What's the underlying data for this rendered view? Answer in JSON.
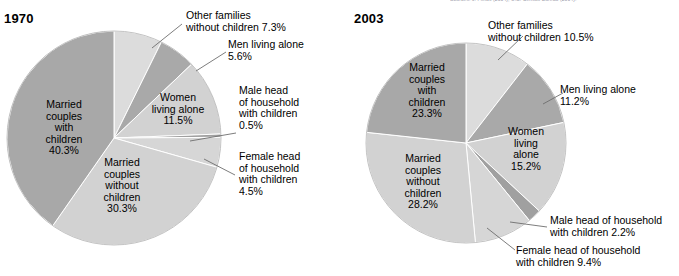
{
  "figure": {
    "clipped_source_line": "Sources: J. Fields (2004), U.S. Census Bureau (2004)."
  },
  "panels": [
    {
      "title": "1970",
      "center": [
        114,
        138
      ],
      "radius": 107,
      "slices": [
        {
          "name": "other-families-without-children",
          "label": "Other families\nwithout children 7.3%",
          "value": 7.3,
          "color": "#dcdcdc"
        },
        {
          "name": "men-living-alone",
          "label": "Men living alone\n5.6%",
          "value": 5.6,
          "color": "#a9a9a9"
        },
        {
          "name": "women-living-alone",
          "label": "Women\nliving alone\n11.5%",
          "value": 11.5,
          "color": "#d2d2d2"
        },
        {
          "name": "male-head-of-household-with-children",
          "label": "Male head\nof household\nwith children\n0.5%",
          "value": 0.5,
          "color": "#a0a0a0"
        },
        {
          "name": "female-head-of-household-with-children",
          "label": "Female head\nof household\nwith children\n4.5%",
          "value": 4.5,
          "color": "#d6d6d6"
        },
        {
          "name": "married-couples-without-children",
          "label": "Married\ncouples\nwithout\nchildren\n30.3%",
          "value": 30.3,
          "color": "#d2d2d2"
        },
        {
          "name": "married-couples-with-children",
          "label": "Married\ncouples\nwith\nchildren\n40.3%",
          "value": 40.3,
          "color": "#a8a8a8"
        }
      ]
    },
    {
      "title": "2003",
      "center": [
        466,
        143
      ],
      "radius": 100,
      "slices": [
        {
          "name": "other-families-without-children",
          "label": "Other families\nwithout children 10.5%",
          "value": 10.5,
          "color": "#dcdcdc"
        },
        {
          "name": "men-living-alone",
          "label": "Men living alone\n11.2%",
          "value": 11.2,
          "color": "#a9a9a9"
        },
        {
          "name": "women-living-alone",
          "label": "Women\nliving\nalone\n15.2%",
          "value": 15.2,
          "color": "#d2d2d2"
        },
        {
          "name": "male-head-of-household-with-children",
          "label": "Male head of household\nwith children 2.2%",
          "value": 2.2,
          "color": "#a0a0a0"
        },
        {
          "name": "female-head-of-household-with-children",
          "label": "Female head of household\nwith children 9.4%",
          "value": 9.4,
          "color": "#d6d6d6"
        },
        {
          "name": "married-couples-without-children",
          "label": "Married\ncouples\nwithout\nchildren\n28.2%",
          "value": 28.2,
          "color": "#d2d2d2"
        },
        {
          "name": "married-couples-with-children",
          "label": "Married\ncouples\nwith\nchildren\n23.3%",
          "value": 23.3,
          "color": "#a8a8a8"
        }
      ]
    }
  ],
  "chart_data": {
    "type": "pie",
    "title": "",
    "legend_position": "callout-labels",
    "charts": [
      {
        "title": "1970",
        "unit": "percent",
        "categories": [
          "Other families without children",
          "Men living alone",
          "Women living alone",
          "Male head of household with children",
          "Female head of household with children",
          "Married couples without children",
          "Married couples with children"
        ],
        "values": [
          7.3,
          5.6,
          11.5,
          0.5,
          4.5,
          30.3,
          40.3
        ],
        "total": 100.0
      },
      {
        "title": "2003",
        "unit": "percent",
        "categories": [
          "Other families without children",
          "Men living alone",
          "Women living alone",
          "Male head of household with children",
          "Female head of household with children",
          "Married couples without children",
          "Married couples with children"
        ],
        "values": [
          10.5,
          11.2,
          15.2,
          2.2,
          9.4,
          28.2,
          23.3
        ],
        "total": 100.0
      }
    ]
  },
  "labels_1970": {
    "other": "Other families\nwithout children 7.3%",
    "men": "Men living alone\n5.6%",
    "women": "Women\nliving alone\n11.5%",
    "male_head": "Male head\nof household\nwith children\n0.5%",
    "female_head": "Female head\nof household\nwith children\n4.5%",
    "mc_without": "Married\ncouples\nwithout\nchildren\n30.3%",
    "mc_with": "Married\ncouples\nwith\nchildren\n40.3%"
  },
  "labels_2003": {
    "other": "Other families\nwithout children 10.5%",
    "men": "Men living alone\n11.2%",
    "women": "Women\nliving\nalone\n15.2%",
    "male_head": "Male head of household\nwith children 2.2%",
    "female_head": "Female head of household\nwith children 9.4%",
    "mc_without": "Married\ncouples\nwithout\nchildren\n28.2%",
    "mc_with": "Married\ncouples\nwith\nchildren\n23.3%"
  }
}
